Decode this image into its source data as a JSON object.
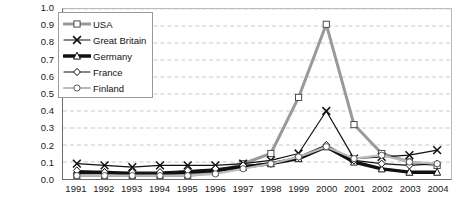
{
  "chart_data": {
    "type": "line",
    "title": "",
    "xlabel": "",
    "ylabel": "",
    "categories": [
      "1991",
      "1992",
      "1993",
      "1994",
      "1995",
      "1996",
      "1997",
      "1998",
      "1999",
      "2000",
      "2001",
      "2002",
      "2003",
      "2004"
    ],
    "x": [
      1991,
      1992,
      1993,
      1994,
      1995,
      1996,
      1997,
      1998,
      1999,
      2000,
      2001,
      2002,
      2003,
      2004
    ],
    "ylim": [
      0.0,
      1.0
    ],
    "ytick_labels": [
      "0.0",
      "0.1",
      "0.2",
      "0.3",
      "0.4",
      "0.5",
      "0.6",
      "0.7",
      "0.8",
      "0.9",
      "1.0"
    ],
    "ytick_values": [
      0.0,
      0.1,
      0.2,
      0.3,
      0.4,
      0.5,
      0.6,
      0.7,
      0.8,
      0.9,
      1.0
    ],
    "grid": true,
    "grid_style": "dashed-horizontal",
    "legend_position": "top-left-inside",
    "series": [
      {
        "name": "USA",
        "color": "#999999",
        "line_width": 3,
        "marker": "square",
        "marker_fill": "#ffffff",
        "values": [
          0.02,
          0.02,
          0.02,
          0.02,
          0.02,
          0.04,
          0.09,
          0.15,
          0.48,
          0.91,
          0.32,
          0.15,
          0.1,
          0.08
        ]
      },
      {
        "name": "Great Britain",
        "color": "#111111",
        "line_width": 1.2,
        "marker": "x",
        "marker_fill": "#111111",
        "values": [
          0.09,
          0.08,
          0.07,
          0.08,
          0.08,
          0.08,
          0.09,
          0.11,
          0.15,
          0.4,
          0.12,
          0.13,
          0.14,
          0.17
        ]
      },
      {
        "name": "Germany",
        "color": "#111111",
        "line_width": 3.4,
        "marker": "triangle",
        "marker_fill": "#ffffff",
        "values": [
          0.04,
          0.04,
          0.03,
          0.03,
          0.04,
          0.05,
          0.07,
          0.09,
          0.12,
          0.19,
          0.1,
          0.06,
          0.04,
          0.04
        ]
      },
      {
        "name": "France",
        "color": "#111111",
        "line_width": 1.2,
        "marker": "diamond",
        "marker_fill": "#ffffff",
        "values": [
          0.05,
          0.04,
          0.04,
          0.04,
          0.05,
          0.06,
          0.08,
          0.09,
          0.13,
          0.2,
          0.11,
          0.09,
          0.08,
          0.09
        ]
      },
      {
        "name": "Finland",
        "color": "#bbbbbb",
        "line_width": 2.2,
        "marker": "circle",
        "marker_fill": "#ffffff",
        "values": [
          0.02,
          0.02,
          0.02,
          0.02,
          0.02,
          0.03,
          0.06,
          0.09,
          0.13,
          0.19,
          0.12,
          0.14,
          0.1,
          0.09
        ]
      }
    ]
  },
  "legend": {
    "items": [
      {
        "label": "USA"
      },
      {
        "label": "Great Britain"
      },
      {
        "label": "Germany"
      },
      {
        "label": "France"
      },
      {
        "label": "Finland"
      }
    ]
  }
}
